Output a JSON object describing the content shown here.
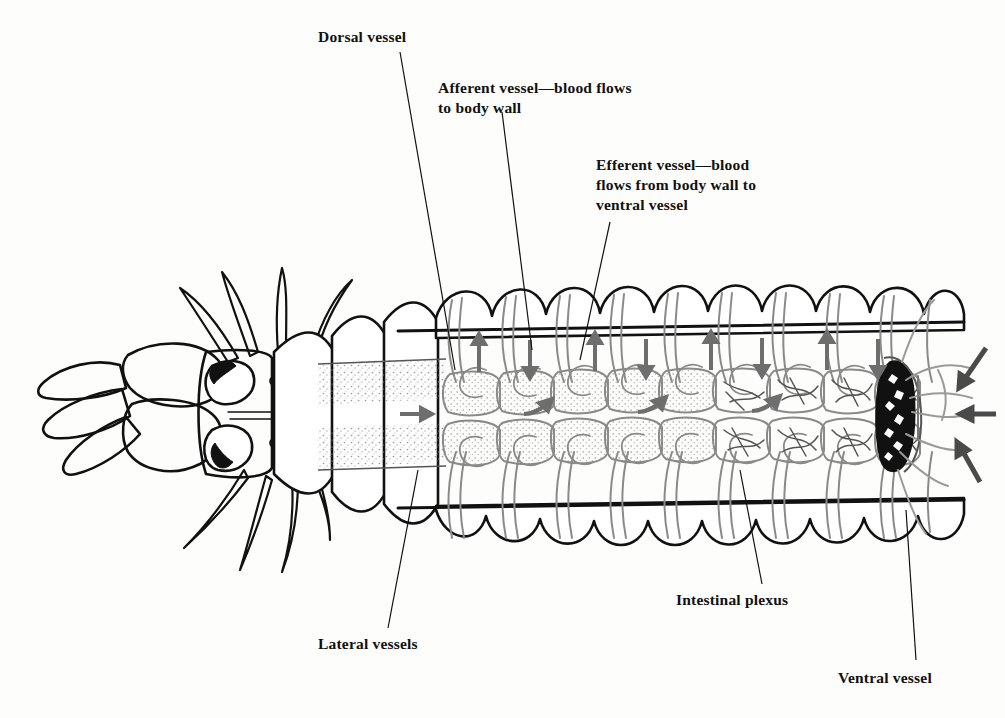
{
  "figure": {
    "organism": "polychaete worm",
    "view": "dorsal",
    "background_color": "#fdfdfb",
    "ink_color": "#111111",
    "vessel_color": "#8a8a8a",
    "arrow_color": "#6e6e6e",
    "dark_arrow_color": "#4a4a4a",
    "stipple_color": "#9a9a9a"
  },
  "labels": [
    {
      "id": "dorsal-vessel",
      "text": "Dorsal vessel",
      "x": 318,
      "y": 27,
      "leader": {
        "x1": 400,
        "y1": 52,
        "x2": 455,
        "y2": 370
      }
    },
    {
      "id": "afferent-vessel",
      "text": "Afferent vessel—blood flows\nto body wall",
      "x": 438,
      "y": 78,
      "leader": {
        "x1": 502,
        "y1": 112,
        "x2": 532,
        "y2": 350
      }
    },
    {
      "id": "efferent-vessel",
      "text": "Efferent vessel—blood\nflows from body wall to\nventral vessel",
      "x": 596,
      "y": 155,
      "leader": {
        "x1": 610,
        "y1": 222,
        "x2": 580,
        "y2": 360
      }
    },
    {
      "id": "lateral-vessels",
      "text": "Lateral vessels",
      "x": 318,
      "y": 634,
      "leader": {
        "x1": 388,
        "y1": 628,
        "x2": 418,
        "y2": 470
      }
    },
    {
      "id": "intestinal-plexus",
      "text": "Intestinal plexus",
      "x": 676,
      "y": 590,
      "leader": {
        "x1": 762,
        "y1": 584,
        "x2": 740,
        "y2": 470
      }
    },
    {
      "id": "ventral-vessel",
      "text": "Ventral vessel",
      "x": 838,
      "y": 668,
      "leader": {
        "x1": 916,
        "y1": 660,
        "x2": 906,
        "y2": 510
      }
    }
  ],
  "anatomy": {
    "head": {
      "palps": 2,
      "jaws": 2,
      "eyes": 4,
      "dorsal_cirri": 4,
      "ventral_cirri": 4,
      "dark_palp_lobes": 2
    },
    "body": {
      "plain_segments": 5,
      "dissected_segments": 14,
      "parapodia_top": 16,
      "parapodia_bottom": 16
    },
    "vessels": {
      "afferent_arrows_up": 4,
      "efferent_arrows_down": 4,
      "lateral_flow_arrows": 4,
      "posterior_inflow_arrows": 3,
      "stippled_chambers": 14,
      "plexus_chambers": 10
    }
  }
}
